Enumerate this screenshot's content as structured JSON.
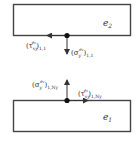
{
  "diagram": {
    "elements": [
      {
        "id": "e2",
        "label_base": "e",
        "label_sub": "2"
      },
      {
        "id": "e1",
        "label_base": "e",
        "label_sub": "1"
      }
    ],
    "top_node": {
      "shear": {
        "base": "(τ",
        "sub": "xy",
        "sup": "e₂",
        "tail": ")",
        "index": "1,1"
      },
      "normal": {
        "base": "(σ",
        "sub": "y",
        "sup": "e₂",
        "tail": ")",
        "index": "1,1"
      }
    },
    "bottom_node": {
      "normal": {
        "base": "(σ",
        "sub": "y",
        "sup": "e₁",
        "tail": ")",
        "index": "1,Ny"
      },
      "shear": {
        "base": "(τ",
        "sub": "xy",
        "sup": "e₁",
        "tail": ")",
        "index": "1,Ny"
      }
    },
    "colors": {
      "line": "#444444",
      "node": "#111111",
      "text": "#333333"
    }
  }
}
